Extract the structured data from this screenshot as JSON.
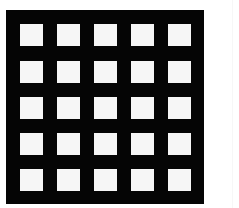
{
  "figure": {
    "rows": 5,
    "columns": 5,
    "colors": {
      "background": "#ffffff",
      "grid": "#050505",
      "cell": "#f6f6f6"
    }
  }
}
